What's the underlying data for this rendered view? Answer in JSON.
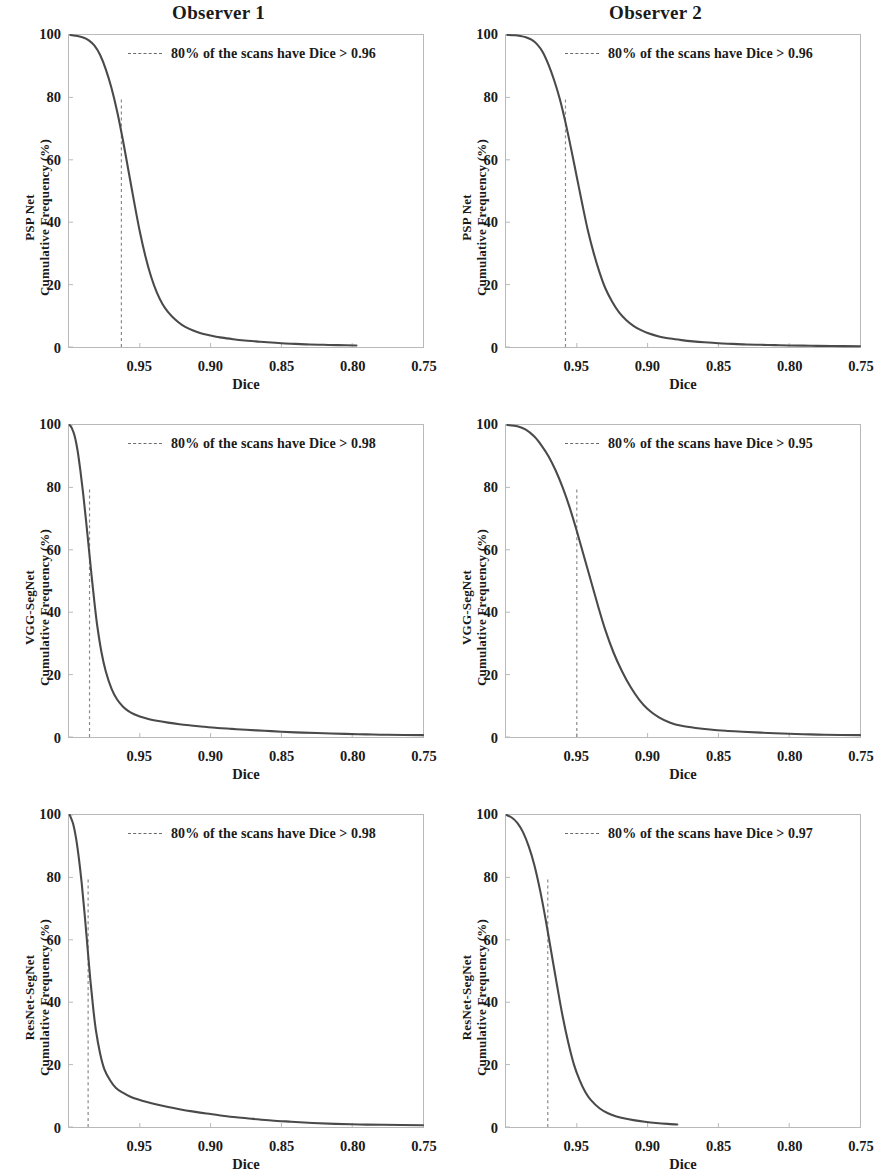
{
  "figure": {
    "column_titles": [
      "Observer 1",
      "Observer 2"
    ],
    "xaxis_title": "Dice",
    "yaxis_common_label": "Cumulative Frequency (%)"
  },
  "chart_data": [
    {
      "id": "pspnet-observer1",
      "type": "line",
      "title": "Observer 1",
      "row_label": "PSP Net",
      "xlabel": "Dice",
      "ylabel": "PSP Net Cumulative Frequency (%)",
      "xlim": [
        1.0,
        0.75
      ],
      "ylim": [
        0,
        100
      ],
      "x_ticks": [
        0.95,
        0.9,
        0.85,
        0.8,
        0.75
      ],
      "x_tick_labels": [
        "0.95",
        "0.90",
        "0.85",
        "0.80",
        "0.75"
      ],
      "y_ticks": [
        0,
        20,
        40,
        60,
        80,
        100
      ],
      "y_tick_labels": [
        "0",
        "20",
        "40",
        "60",
        "80",
        "100"
      ],
      "grid": false,
      "legend_position": "top-center",
      "legend": "80% of the scans have Dice > 0.96",
      "threshold_line": {
        "x": 0.963,
        "percentile": 80,
        "style": "dashed"
      },
      "curve_x_end": 0.797,
      "x": [
        0.999,
        0.994,
        0.99,
        0.986,
        0.982,
        0.978,
        0.974,
        0.97,
        0.966,
        0.962,
        0.958,
        0.954,
        0.95,
        0.946,
        0.942,
        0.938,
        0.934,
        0.93,
        0.925,
        0.92,
        0.915,
        0.91,
        0.905,
        0.9,
        0.892,
        0.884,
        0.876,
        0.868,
        0.86,
        0.85,
        0.84,
        0.83,
        0.82,
        0.81,
        0.797
      ],
      "y": [
        100.0,
        99.7,
        99.2,
        98.3,
        96.6,
        93.6,
        89.0,
        83.0,
        75.5,
        66.5,
        56.5,
        46.5,
        37.0,
        29.0,
        22.5,
        17.5,
        13.8,
        11.2,
        8.8,
        7.0,
        5.8,
        4.9,
        4.2,
        3.7,
        3.0,
        2.5,
        2.1,
        1.8,
        1.5,
        1.2,
        1.0,
        0.8,
        0.7,
        0.6,
        0.5
      ]
    },
    {
      "id": "pspnet-observer2",
      "type": "line",
      "title": "Observer 2",
      "row_label": "PSP Net",
      "xlabel": "Dice",
      "ylabel": "PSP Net Cumulative Frequency (%)",
      "xlim": [
        1.0,
        0.75
      ],
      "ylim": [
        0,
        100
      ],
      "x_ticks": [
        0.95,
        0.9,
        0.85,
        0.8,
        0.75
      ],
      "x_tick_labels": [
        "0.95",
        "0.90",
        "0.85",
        "0.80",
        "0.75"
      ],
      "y_ticks": [
        0,
        20,
        40,
        60,
        80,
        100
      ],
      "y_tick_labels": [
        "0",
        "20",
        "40",
        "60",
        "80",
        "100"
      ],
      "grid": false,
      "legend_position": "top-center",
      "legend": "80% of the scans have Dice > 0.96",
      "threshold_line": {
        "x": 0.958,
        "percentile": 80,
        "style": "dashed"
      },
      "curve_x_end": 0.75,
      "x": [
        0.999,
        0.994,
        0.99,
        0.986,
        0.982,
        0.978,
        0.974,
        0.97,
        0.966,
        0.962,
        0.958,
        0.954,
        0.95,
        0.946,
        0.942,
        0.938,
        0.934,
        0.93,
        0.925,
        0.92,
        0.915,
        0.91,
        0.905,
        0.9,
        0.892,
        0.884,
        0.876,
        0.868,
        0.86,
        0.85,
        0.84,
        0.83,
        0.82,
        0.81,
        0.8,
        0.785,
        0.77,
        0.75
      ],
      "y": [
        100.0,
        99.9,
        99.7,
        99.3,
        98.5,
        97.0,
        94.5,
        90.5,
        85.5,
        79.5,
        72.0,
        63.5,
        54.5,
        45.5,
        37.0,
        30.0,
        24.0,
        19.0,
        14.5,
        11.0,
        8.6,
        6.8,
        5.5,
        4.5,
        3.4,
        2.7,
        2.2,
        1.8,
        1.5,
        1.2,
        1.0,
        0.8,
        0.7,
        0.6,
        0.5,
        0.4,
        0.3,
        0.25
      ]
    },
    {
      "id": "vggsegnet-observer1",
      "type": "line",
      "title": "Observer 1",
      "row_label": "VGG-SegNet",
      "xlabel": "Dice",
      "ylabel": "VGG-SegNet Cumulative Frequency (%)",
      "xlim": [
        1.0,
        0.75
      ],
      "ylim": [
        0,
        100
      ],
      "x_ticks": [
        0.95,
        0.9,
        0.85,
        0.8,
        0.75
      ],
      "x_tick_labels": [
        "0.95",
        "0.90",
        "0.85",
        "0.80",
        "0.75"
      ],
      "y_ticks": [
        0,
        20,
        40,
        60,
        80,
        100
      ],
      "y_tick_labels": [
        "0",
        "20",
        "40",
        "60",
        "80",
        "100"
      ],
      "grid": false,
      "legend_position": "top-center",
      "legend": "80% of the scans have Dice > 0.98",
      "threshold_line": {
        "x": 0.9855,
        "percentile": 80,
        "style": "dashed"
      },
      "curve_x_end": 0.75,
      "x": [
        0.9995,
        0.998,
        0.996,
        0.994,
        0.992,
        0.99,
        0.988,
        0.986,
        0.984,
        0.982,
        0.98,
        0.977,
        0.974,
        0.97,
        0.966,
        0.962,
        0.958,
        0.954,
        0.95,
        0.944,
        0.938,
        0.93,
        0.922,
        0.914,
        0.905,
        0.895,
        0.885,
        0.875,
        0.862,
        0.85,
        0.835,
        0.82,
        0.805,
        0.79,
        0.775,
        0.75
      ],
      "y": [
        100.0,
        99.0,
        96.5,
        92.0,
        85.5,
        78.0,
        69.5,
        60.5,
        51.5,
        43.0,
        35.5,
        27.0,
        21.0,
        15.5,
        12.0,
        9.8,
        8.3,
        7.3,
        6.6,
        5.8,
        5.2,
        4.6,
        4.1,
        3.7,
        3.3,
        2.9,
        2.6,
        2.3,
        2.0,
        1.7,
        1.4,
        1.2,
        1.0,
        0.85,
        0.7,
        0.6
      ]
    },
    {
      "id": "vggsegnet-observer2",
      "type": "line",
      "title": "Observer 2",
      "row_label": "VGG-SegNet",
      "xlabel": "Dice",
      "ylabel": "VGG-SegNet Cumulative Frequency (%)",
      "xlim": [
        1.0,
        0.75
      ],
      "ylim": [
        0,
        100
      ],
      "x_ticks": [
        0.95,
        0.9,
        0.85,
        0.8,
        0.75
      ],
      "x_tick_labels": [
        "0.95",
        "0.90",
        "0.85",
        "0.80",
        "0.75"
      ],
      "y_ticks": [
        0,
        20,
        40,
        60,
        80,
        100
      ],
      "y_tick_labels": [
        "0",
        "20",
        "40",
        "60",
        "80",
        "100"
      ],
      "grid": false,
      "legend_position": "top-center",
      "legend": "80% of the scans have Dice > 0.95",
      "threshold_line": {
        "x": 0.95,
        "percentile": 80,
        "style": "dashed"
      },
      "curve_x_end": 0.75,
      "x": [
        0.999,
        0.992,
        0.986,
        0.98,
        0.975,
        0.97,
        0.965,
        0.96,
        0.955,
        0.95,
        0.945,
        0.94,
        0.935,
        0.93,
        0.924,
        0.918,
        0.912,
        0.906,
        0.9,
        0.892,
        0.884,
        0.876,
        0.866,
        0.856,
        0.845,
        0.833,
        0.82,
        0.805,
        0.79,
        0.775,
        0.75
      ],
      "y": [
        100.0,
        99.6,
        98.5,
        96.3,
        93.5,
        90.0,
        85.5,
        80.0,
        73.5,
        66.0,
        58.0,
        50.0,
        42.0,
        34.5,
        27.0,
        21.0,
        16.0,
        12.0,
        9.0,
        6.3,
        4.6,
        3.6,
        2.9,
        2.4,
        2.0,
        1.7,
        1.4,
        1.1,
        0.9,
        0.7,
        0.6
      ]
    },
    {
      "id": "resnetsegnet-observer1",
      "type": "line",
      "title": "Observer 1",
      "row_label": "ResNet-SegNet",
      "xlabel": "Dice",
      "ylabel": "ResNet-SegNet Cumulative Frequency (%)",
      "xlim": [
        1.0,
        0.75
      ],
      "ylim": [
        0,
        100
      ],
      "x_ticks": [
        0.95,
        0.9,
        0.85,
        0.8,
        0.75
      ],
      "x_tick_labels": [
        "0.95",
        "0.90",
        "0.85",
        "0.80",
        "0.75"
      ],
      "y_ticks": [
        0,
        20,
        40,
        60,
        80,
        100
      ],
      "y_tick_labels": [
        "0",
        "20",
        "40",
        "60",
        "80",
        "100"
      ],
      "grid": false,
      "legend_position": "top-center",
      "legend": "80% of the scans have Dice > 0.98",
      "threshold_line": {
        "x": 0.9865,
        "percentile": 80,
        "style": "dashed"
      },
      "curve_x_end": 0.75,
      "x": [
        0.9995,
        0.999,
        0.997,
        0.995,
        0.993,
        0.991,
        0.989,
        0.987,
        0.985,
        0.983,
        0.981,
        0.978,
        0.975,
        0.971,
        0.967,
        0.962,
        0.957,
        0.951,
        0.945,
        0.938,
        0.93,
        0.922,
        0.913,
        0.903,
        0.893,
        0.882,
        0.87,
        0.857,
        0.843,
        0.828,
        0.812,
        0.795,
        0.778,
        0.75
      ],
      "y": [
        100.0,
        99.5,
        97.0,
        92.5,
        86.0,
        78.0,
        68.5,
        58.0,
        47.5,
        38.5,
        31.0,
        23.5,
        18.5,
        15.0,
        12.6,
        11.0,
        9.8,
        8.8,
        8.0,
        7.2,
        6.4,
        5.7,
        5.0,
        4.3,
        3.7,
        3.1,
        2.6,
        2.1,
        1.7,
        1.3,
        1.0,
        0.8,
        0.7,
        0.55
      ]
    },
    {
      "id": "resnetsegnet-observer2",
      "type": "line",
      "title": "Observer 2",
      "row_label": "ResNet-SegNet",
      "xlabel": "Dice",
      "ylabel": "ResNet-SegNet Cumulative Frequency (%)",
      "xlim": [
        1.0,
        0.75
      ],
      "ylim": [
        0,
        100
      ],
      "x_ticks": [
        0.95,
        0.9,
        0.85,
        0.8,
        0.75
      ],
      "x_tick_labels": [
        "0.95",
        "0.90",
        "0.85",
        "0.80",
        "0.75"
      ],
      "y_ticks": [
        0,
        20,
        40,
        60,
        80,
        100
      ],
      "y_tick_labels": [
        "0",
        "20",
        "40",
        "60",
        "80",
        "100"
      ],
      "grid": false,
      "legend_position": "top-center",
      "legend": "80% of the scans have Dice > 0.97",
      "threshold_line": {
        "x": 0.9705,
        "percentile": 80,
        "style": "dashed"
      },
      "curve_x_end": 0.879,
      "x": [
        0.9995,
        0.996,
        0.992,
        0.988,
        0.984,
        0.98,
        0.976,
        0.972,
        0.968,
        0.964,
        0.96,
        0.956,
        0.952,
        0.948,
        0.944,
        0.94,
        0.934,
        0.928,
        0.922,
        0.916,
        0.91,
        0.902,
        0.894,
        0.886,
        0.879
      ],
      "y": [
        100.0,
        99.2,
        97.5,
        94.5,
        90.0,
        84.0,
        76.0,
        66.5,
        56.0,
        45.5,
        35.5,
        27.0,
        20.0,
        15.0,
        11.2,
        8.6,
        6.0,
        4.4,
        3.4,
        2.7,
        2.2,
        1.7,
        1.3,
        1.0,
        0.8
      ]
    }
  ],
  "colors": {
    "curve": "#4a4a4a",
    "frame": "#b9b9b9",
    "dash": "#8a8a8a",
    "text": "#1a1a1a"
  }
}
